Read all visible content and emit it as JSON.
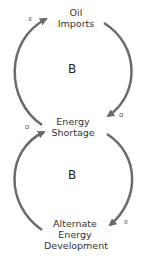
{
  "diagram": {
    "type": "causal-loop",
    "nodes": {
      "oil_imports": {
        "lines": [
          "Oil",
          "Imports"
        ]
      },
      "energy_shortage": {
        "lines": [
          "Energy",
          "Shortage"
        ]
      },
      "alternate_energy": {
        "lines": [
          "Alternate",
          "Energy",
          "Development"
        ]
      }
    },
    "loops": [
      {
        "id": "top",
        "label": "B"
      },
      {
        "id": "bottom",
        "label": "B"
      }
    ],
    "links": [
      {
        "from": "Oil Imports",
        "to": "Energy Shortage",
        "polarity": "o"
      },
      {
        "from": "Energy Shortage",
        "to": "Oil Imports",
        "polarity": "s"
      },
      {
        "from": "Energy Shortage",
        "to": "Alternate Energy Development",
        "polarity": "s"
      },
      {
        "from": "Alternate Energy Development",
        "to": "Energy Shortage",
        "polarity": "o"
      }
    ],
    "colors": {
      "arrow": "#6b6b6b",
      "text": "#333333"
    }
  }
}
